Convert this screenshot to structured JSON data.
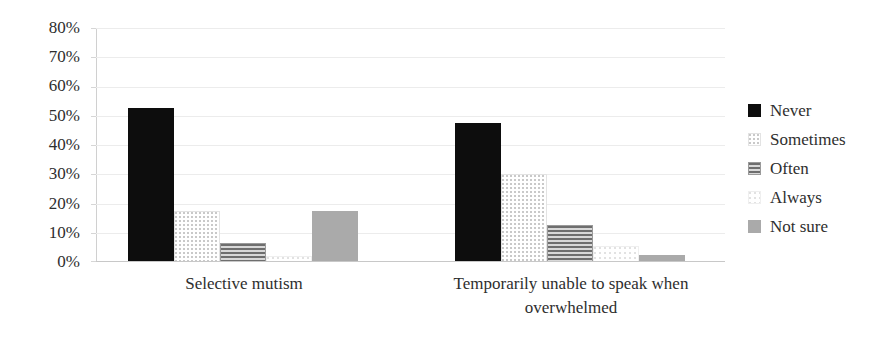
{
  "chart_data": {
    "type": "bar",
    "title": "",
    "subtitle": "",
    "xlabel": "",
    "ylabel": "",
    "ylim": [
      0,
      80
    ],
    "y_tick_labels": [
      "80%",
      "70%",
      "60%",
      "50%",
      "40%",
      "30%",
      "20%",
      "10%",
      "0%"
    ],
    "y_tick_values": [
      80,
      70,
      60,
      50,
      40,
      30,
      20,
      10,
      0
    ],
    "y_tick_interval": 10,
    "y_unit": "%",
    "grid": "horizontal",
    "legend_position": "right",
    "categories": [
      "Selective mutism",
      "Temporarily unable to speak when overwhelmed"
    ],
    "category_lines": [
      [
        "Selective mutism"
      ],
      [
        "Temporarily unable to speak when",
        "overwhelmed"
      ]
    ],
    "series": [
      {
        "name": "Never",
        "values": [
          52.5,
          47.5
        ],
        "color": "#0d0d0d",
        "pattern": "solid"
      },
      {
        "name": "Sometimes",
        "values": [
          17.5,
          30.0
        ],
        "color": "#c9c9c9",
        "pattern": "dots-light"
      },
      {
        "name": "Often",
        "values": [
          6.5,
          12.5
        ],
        "color": "#6e6e6e",
        "pattern": "horizontal-lines"
      },
      {
        "name": "Always",
        "values": [
          2.0,
          5.5
        ],
        "color": "#e2e2e2",
        "pattern": "dots-faint"
      },
      {
        "name": "Not sure",
        "values": [
          17.5,
          2.5
        ],
        "color": "#aaaaaa",
        "pattern": "solid-gray"
      }
    ]
  },
  "legend": {
    "items": [
      {
        "label": "Never"
      },
      {
        "label": "Sometimes"
      },
      {
        "label": "Often"
      },
      {
        "label": "Always"
      },
      {
        "label": "Not sure"
      }
    ]
  },
  "axis": {
    "y_labels": [
      "80%",
      "70%",
      "60%",
      "50%",
      "40%",
      "30%",
      "20%",
      "10%",
      "0%"
    ]
  },
  "x_axis": {
    "labels": [
      {
        "line1": "Selective mutism",
        "line2": ""
      },
      {
        "line1": "Temporarily unable to speak when",
        "line2": "overwhelmed"
      }
    ]
  }
}
